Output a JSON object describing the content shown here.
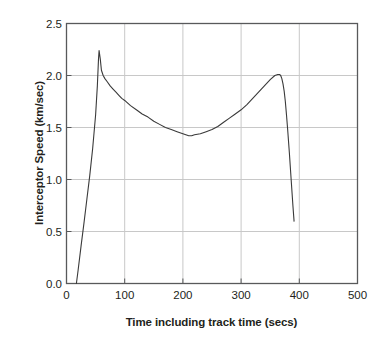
{
  "chart_data": {
    "type": "line",
    "title": "",
    "xlabel": "Time including track time (secs)",
    "ylabel": "Interceptor Speed (km/sec)",
    "xlim": [
      0,
      500
    ],
    "ylim": [
      0,
      2.5
    ],
    "xticks": [
      "0",
      "100",
      "200",
      "300",
      "400",
      "500"
    ],
    "xtick_values": [
      0,
      100,
      200,
      300,
      400,
      500
    ],
    "yticks": [
      "0.0",
      "0.5",
      "1.0",
      "1.5",
      "2.0",
      "2.5"
    ],
    "ytick_values": [
      0.0,
      0.5,
      1.0,
      1.5,
      2.0,
      2.5
    ],
    "grid": true,
    "grid_color": "#c8c8c8",
    "legend": null,
    "line_color": "#3a3a3a",
    "line_width": 1.1,
    "frame_color": "#58595b",
    "background": "#ffffff",
    "series": [
      {
        "name": "Interceptor Speed",
        "x": [
          17,
          20,
          25,
          30,
          35,
          40,
          45,
          50,
          53,
          55,
          56,
          58,
          60,
          63,
          66,
          70,
          75,
          80,
          85,
          90,
          95,
          100,
          110,
          120,
          130,
          140,
          150,
          160,
          170,
          180,
          190,
          200,
          205,
          210,
          215,
          220,
          230,
          240,
          250,
          260,
          270,
          280,
          290,
          300,
          310,
          320,
          330,
          340,
          350,
          358,
          363,
          366,
          368,
          370,
          372,
          374,
          376,
          378,
          380,
          383,
          386,
          389,
          391
        ],
        "y": [
          0.0,
          0.13,
          0.36,
          0.58,
          0.81,
          1.04,
          1.3,
          1.62,
          1.9,
          2.16,
          2.24,
          2.16,
          2.05,
          2.0,
          1.97,
          1.94,
          1.9,
          1.87,
          1.84,
          1.81,
          1.78,
          1.76,
          1.71,
          1.67,
          1.63,
          1.6,
          1.56,
          1.53,
          1.5,
          1.48,
          1.46,
          1.44,
          1.43,
          1.42,
          1.42,
          1.43,
          1.44,
          1.46,
          1.48,
          1.51,
          1.55,
          1.59,
          1.63,
          1.67,
          1.72,
          1.78,
          1.84,
          1.9,
          1.96,
          2.0,
          2.01,
          2.01,
          2.0,
          1.97,
          1.92,
          1.85,
          1.75,
          1.62,
          1.48,
          1.25,
          1.0,
          0.75,
          0.6
        ]
      }
    ],
    "annotations": {
      "first_peak": {
        "x": 56,
        "y": 2.24
      },
      "valley_min": {
        "x": 212,
        "y": 1.42
      },
      "second_peak": {
        "x": 365,
        "y": 2.01
      },
      "launch_start": {
        "x": 17,
        "y": 0.0
      },
      "end_point": {
        "x": 391,
        "y": 0.6
      }
    }
  }
}
